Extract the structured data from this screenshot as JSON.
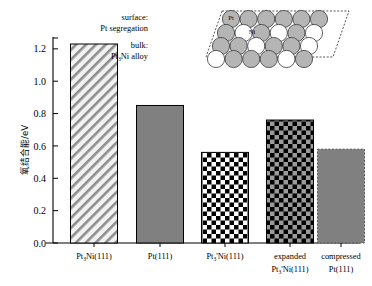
{
  "chart_data": {
    "type": "bar",
    "title": "",
    "xlabel": "",
    "ylabel": "氧结合能/eV",
    "ylim": [
      0.0,
      1.33
    ],
    "grid": false,
    "legend": "none",
    "ytick_labels": [
      "0.0",
      "0.2",
      "0.4",
      "0.6",
      "0.8",
      "1.0",
      "1.2"
    ],
    "ytick_values": [
      0.0,
      0.2,
      0.4,
      0.6,
      0.8,
      1.0,
      1.2
    ],
    "categories": [
      "Pt3Ni(111)",
      "Pt(111)",
      "Pt3'Ni(111)",
      "expanded Pt3'Ni(111)",
      "compressed Pt(111)"
    ],
    "values": [
      1.23,
      0.85,
      0.56,
      0.76,
      0.58
    ],
    "bar_styles": [
      "diagonal-hatch",
      "solid-gray",
      "checker-black-white",
      "checker-black-gray",
      "solid-gray-dashed"
    ]
  },
  "axis": {
    "ylabel": "氧结合能/eV",
    "ticks": [
      {
        "label": "0.0",
        "value": 0.0
      },
      {
        "label": "0.2",
        "value": 0.2
      },
      {
        "label": "0.4",
        "value": 0.4
      },
      {
        "label": "0.6",
        "value": 0.6
      },
      {
        "label": "0.8",
        "value": 0.8
      },
      {
        "label": "1.0",
        "value": 1.0
      },
      {
        "label": "1.2",
        "value": 1.2
      }
    ]
  },
  "categories": [
    {
      "line1": "Pt",
      "sub1": "3",
      "line1b": "Ni(111)",
      "line2": "",
      "sub2": "",
      "line2b": ""
    },
    {
      "line1": "Pt(111)",
      "sub1": "",
      "line1b": "",
      "line2": "",
      "sub2": "",
      "line2b": ""
    },
    {
      "line1": "Pt",
      "sub1": "3",
      "line1b": "'Ni(111)",
      "line2": "",
      "sub2": "",
      "line2b": ""
    },
    {
      "line1": "expanded",
      "sub1": "",
      "line1b": "",
      "line2": "Pt",
      "sub2": "3",
      "line2b": "'Ni(111)"
    },
    {
      "line1": "compressed",
      "sub1": "",
      "line1b": "",
      "line2": "Pt(111)",
      "sub2": "",
      "line2b": ""
    }
  ],
  "inset": {
    "surface_line1": "surface:",
    "surface_line2": "Pt segregation",
    "bulk_line1": "bulk:",
    "bulk_line2_a": "Pt",
    "bulk_line2_sub": "3",
    "bulk_line2_b": "Ni alloy",
    "atom_pt_label": "Pt",
    "atom_ni_label": "Ni"
  },
  "colors": {
    "bar_gray": "#808080",
    "hatch_bg": "#f2f2f2",
    "checker_black": "#000000",
    "checker_white": "#ffffff",
    "checker_gray": "#9a9a9a",
    "atom_pt": "#b5b5b5",
    "atom_ni": "#ffffff",
    "axis": "#000000"
  }
}
